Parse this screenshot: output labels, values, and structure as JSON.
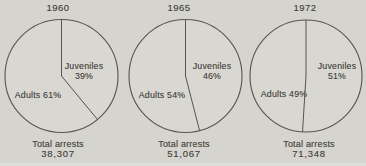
{
  "page": {
    "background_color": "#d5d4cf",
    "ink_color": "#4a4944"
  },
  "chart_data": [
    {
      "type": "pie",
      "title": "1960",
      "categories": [
        "Juveniles",
        "Adults"
      ],
      "values": [
        39,
        61
      ],
      "unit": "percent",
      "slice_labels": {
        "juvenile_name": "Juveniles",
        "juvenile_pct": "39%",
        "adult": "Adults 61%"
      },
      "total_label": "Total arrests",
      "total_value": "38,307",
      "total_arrests": 38307,
      "legend_position": "inside",
      "start_angle_deg": 0,
      "direction": "clockwise"
    },
    {
      "type": "pie",
      "title": "1965",
      "categories": [
        "Juveniles",
        "Adults"
      ],
      "values": [
        46,
        54
      ],
      "unit": "percent",
      "slice_labels": {
        "juvenile_name": "Juveniles",
        "juvenile_pct": "46%",
        "adult": "Adults 54%"
      },
      "total_label": "Total arrests",
      "total_value": "51,067",
      "total_arrests": 51067,
      "legend_position": "inside",
      "start_angle_deg": 0,
      "direction": "clockwise"
    },
    {
      "type": "pie",
      "title": "1972",
      "categories": [
        "Juveniles",
        "Adults"
      ],
      "values": [
        51,
        49
      ],
      "unit": "percent",
      "slice_labels": {
        "juvenile_name": "Juveniles",
        "juvenile_pct": "51%",
        "adult": "Adults 49%"
      },
      "total_label": "Total arrests",
      "total_value": "71,348",
      "total_arrests": 71348,
      "legend_position": "inside",
      "start_angle_deg": 0,
      "direction": "clockwise"
    }
  ]
}
